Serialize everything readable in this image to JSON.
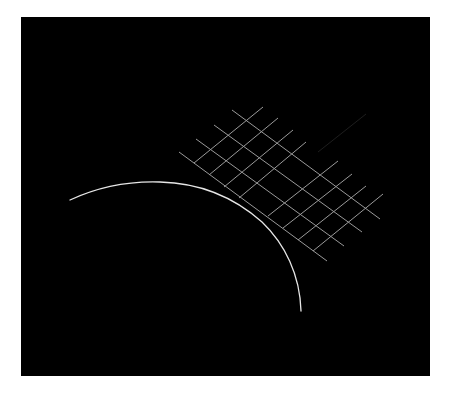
{
  "figure": {
    "background_color": "#ffffff",
    "panel": {
      "color": "#000000",
      "x": 21,
      "y": 17,
      "width": 409,
      "height": 359
    },
    "arc": {
      "color": "#e6e6e6",
      "stroke_width": 1.3,
      "path": "M70,200 C100,186 130,181 160,182 C200,183 235,198 262,222 C285,244 300,275 301,311"
    },
    "grid": {
      "color": "#9a9a9a",
      "stroke_width": 1,
      "long_lines": [
        {
          "x1": 232,
          "y1": 110,
          "x2": 380,
          "y2": 219
        },
        {
          "x1": 214,
          "y1": 125,
          "x2": 362,
          "y2": 232
        },
        {
          "x1": 196,
          "y1": 139,
          "x2": 344,
          "y2": 246
        },
        {
          "x1": 179,
          "y1": 152,
          "x2": 327,
          "y2": 261
        }
      ],
      "short_lines_left_group": [
        {
          "x1": 194,
          "y1": 163,
          "x2": 263,
          "y2": 107
        },
        {
          "x1": 209,
          "y1": 175,
          "x2": 278,
          "y2": 118
        },
        {
          "x1": 224,
          "y1": 187,
          "x2": 293,
          "y2": 130
        },
        {
          "x1": 239,
          "y1": 198,
          "x2": 306,
          "y2": 142
        }
      ],
      "short_lines_right_group": [
        {
          "x1": 268,
          "y1": 216,
          "x2": 338,
          "y2": 161
        },
        {
          "x1": 283,
          "y1": 228,
          "x2": 352,
          "y2": 174
        },
        {
          "x1": 298,
          "y1": 240,
          "x2": 366,
          "y2": 186
        },
        {
          "x1": 313,
          "y1": 251,
          "x2": 383,
          "y2": 194
        }
      ]
    },
    "faint_line": {
      "color": "#1e1e1e",
      "x1": 366,
      "y1": 114,
      "x2": 318,
      "y2": 152
    }
  }
}
